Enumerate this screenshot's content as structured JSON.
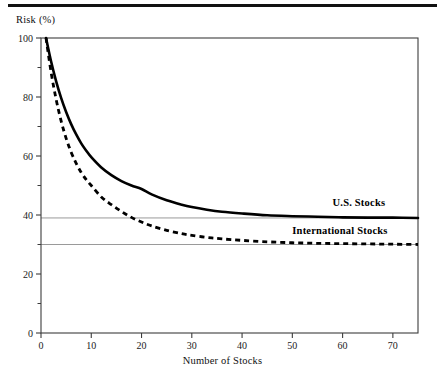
{
  "figure": {
    "has_top_rule": true,
    "background_color": "#ffffff",
    "ink_color": "#000000",
    "asymptote_color": "#9a9a9a",
    "axis_color": "#3c3c3c"
  },
  "chart_data": {
    "type": "line",
    "title": "",
    "subtitle": "",
    "xlabel": "Number of Stocks",
    "ylabel": "Risk (%)",
    "xlim": [
      0,
      75
    ],
    "ylim": [
      0,
      100
    ],
    "xticks": [
      0,
      10,
      20,
      30,
      40,
      50,
      60,
      70
    ],
    "xtick_labels": [
      "0",
      "10",
      "20",
      "30",
      "40",
      "50",
      "60",
      "70"
    ],
    "yticks": [
      0,
      20,
      40,
      60,
      80,
      100
    ],
    "ytick_labels": [
      "0",
      "20",
      "40",
      "60",
      "80",
      "100"
    ],
    "y_minor_ticks": [
      10,
      30,
      50,
      70,
      90
    ],
    "grid": false,
    "legend_position": "inline-right",
    "annotations": [
      {
        "text": "U.S. Stocks",
        "x": 58,
        "y": 43,
        "series": "U.S. Stocks"
      },
      {
        "text": "International Stocks",
        "x": 50,
        "y": 33.5,
        "series": "International Stocks"
      }
    ],
    "reference_lines": [
      {
        "label": "U.S. Stocks asymptote",
        "y": 39,
        "style": "thin-gray"
      },
      {
        "label": "International Stocks asymptote",
        "y": 30,
        "style": "thin-gray"
      }
    ],
    "x": [
      1,
      2,
      3,
      4,
      5,
      6,
      7,
      8,
      9,
      10,
      12,
      14,
      16,
      18,
      20,
      22,
      25,
      28,
      30,
      33,
      36,
      40,
      45,
      50,
      55,
      60,
      65,
      70,
      75
    ],
    "series": [
      {
        "name": "U.S. Stocks",
        "style": "solid",
        "asymptote": 39,
        "values": [
          100,
          92.1,
          85.4,
          79.7,
          74.9,
          70.8,
          67.3,
          64.3,
          61.8,
          59.6,
          56.1,
          53.5,
          51.5,
          50.0,
          48.8,
          47.0,
          45.0,
          43.5,
          42.7,
          41.8,
          41.1,
          40.5,
          39.9,
          39.6,
          39.4,
          39.2,
          39.1,
          39.1,
          39.0
        ]
      },
      {
        "name": "International Stocks",
        "style": "dashed",
        "asymptote": 30,
        "values": [
          100,
          88.5,
          79.3,
          71.9,
          66.0,
          61.3,
          57.5,
          54.4,
          52.0,
          50.0,
          46.1,
          43.5,
          41.2,
          39.2,
          37.6,
          36.3,
          34.8,
          33.7,
          33.1,
          32.4,
          31.9,
          31.4,
          30.9,
          30.6,
          30.4,
          30.3,
          30.2,
          30.1,
          30.0
        ]
      }
    ]
  }
}
